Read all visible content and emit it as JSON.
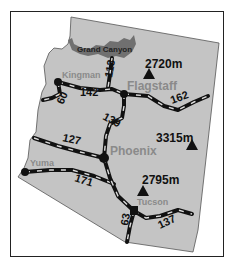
{
  "map": {
    "region": "Arizona",
    "colors": {
      "land": "#c4c4c4",
      "canyon": "#707070",
      "road": "#111111",
      "city_label": "#8a8a8a",
      "frame": "#222222"
    },
    "landmark": {
      "label": "Grand Canyon"
    },
    "cities": [
      {
        "name": "Kingman"
      },
      {
        "name": "Flagstaff"
      },
      {
        "name": "Phoenix"
      },
      {
        "name": "Yuma"
      },
      {
        "name": "Tucson"
      }
    ],
    "peaks": [
      {
        "label": "2720m"
      },
      {
        "label": "3315m"
      },
      {
        "label": "2795m"
      }
    ],
    "roads": [
      {
        "label": "113"
      },
      {
        "label": "142"
      },
      {
        "label": "60"
      },
      {
        "label": "162"
      },
      {
        "label": "139"
      },
      {
        "label": "127"
      },
      {
        "label": "171"
      },
      {
        "label": "63"
      },
      {
        "label": "137"
      }
    ]
  }
}
